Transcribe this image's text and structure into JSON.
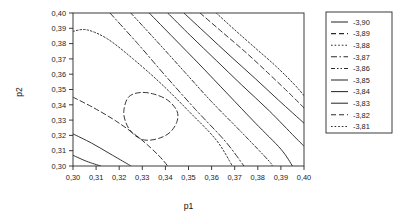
{
  "chart_data": {
    "type": "line",
    "subtype": "contour",
    "title": "",
    "xlabel": "p1",
    "ylabel": "p2",
    "xlim": [
      0.3,
      0.4
    ],
    "ylim": [
      0.3,
      0.4
    ],
    "grid": false,
    "decimal_separator": ",",
    "x_tick_labels": [
      "0,30",
      "0,31",
      "0,32",
      "0,33",
      "0,34",
      "0,35",
      "0,36",
      "0,37",
      "0,38",
      "0,39",
      "0,40"
    ],
    "y_tick_labels": [
      "0,30",
      "0,31",
      "0,32",
      "0,33",
      "0,34",
      "0,35",
      "0,36",
      "0,37",
      "0,38",
      "0,39",
      "0,40"
    ],
    "x_tick_values": [
      0.3,
      0.31,
      0.32,
      0.33,
      0.34,
      0.35,
      0.36,
      0.37,
      0.38,
      0.39,
      0.4
    ],
    "y_tick_values": [
      0.3,
      0.31,
      0.32,
      0.33,
      0.34,
      0.35,
      0.36,
      0.37,
      0.38,
      0.39,
      0.4
    ],
    "legend_position": "right-outside",
    "legend_title": "",
    "levels": [
      {
        "label": "-3,90",
        "value": -3.9,
        "dash": "none"
      },
      {
        "label": "-3,89",
        "value": -3.89,
        "dash": "5,3"
      },
      {
        "label": "-3,88",
        "value": -3.88,
        "dash": "1.6,2"
      },
      {
        "label": "-3,87",
        "value": -3.87,
        "dash": "6,2.5,1.5,2.5"
      },
      {
        "label": "-3,86",
        "value": -3.86,
        "dash": "4,2,1.5,2,1.5,2"
      },
      {
        "label": "-3,85",
        "value": -3.85,
        "dash": "none"
      },
      {
        "label": "-3,84",
        "value": -3.84,
        "dash": "none"
      },
      {
        "label": "-3,83",
        "value": -3.83,
        "dash": "none"
      },
      {
        "label": "-3,82",
        "value": -3.82,
        "dash": "5,3"
      },
      {
        "label": "-3,81",
        "value": -3.81,
        "dash": "1.6,2"
      }
    ],
    "extremum": {
      "x": 0.335,
      "y": 0.333,
      "label": "-3,82 closed contour (local optimum)"
    },
    "contours": [
      {
        "level": "-3,81",
        "dash": "1.6,2",
        "points": [
          [
            0.362,
            0.4
          ],
          [
            0.37,
            0.389
          ],
          [
            0.379,
            0.377
          ],
          [
            0.388,
            0.365
          ],
          [
            0.396,
            0.353
          ],
          [
            0.4,
            0.346
          ]
        ]
      },
      {
        "level": "-3,82",
        "dash": "5,3",
        "points": [
          [
            0.324,
            0.345
          ],
          [
            0.329,
            0.348
          ],
          [
            0.335,
            0.347
          ],
          [
            0.341,
            0.343
          ],
          [
            0.345,
            0.336
          ],
          [
            0.345,
            0.329
          ],
          [
            0.342,
            0.322
          ],
          [
            0.337,
            0.318
          ],
          [
            0.331,
            0.317
          ],
          [
            0.326,
            0.321
          ],
          [
            0.323,
            0.328
          ],
          [
            0.322,
            0.336
          ],
          [
            0.324,
            0.345
          ]
        ]
      },
      {
        "level": "-3,82b",
        "dash": "5,3",
        "points": [
          [
            0.355,
            0.4
          ],
          [
            0.365,
            0.387
          ],
          [
            0.375,
            0.374
          ],
          [
            0.385,
            0.36
          ],
          [
            0.394,
            0.347
          ],
          [
            0.4,
            0.338
          ]
        ]
      },
      {
        "level": "-3,83",
        "dash": "none",
        "points": [
          [
            0.348,
            0.4
          ],
          [
            0.358,
            0.386
          ],
          [
            0.368,
            0.372
          ],
          [
            0.379,
            0.357
          ],
          [
            0.389,
            0.343
          ],
          [
            0.4,
            0.328
          ]
        ]
      },
      {
        "level": "-3,84",
        "dash": "none",
        "points": [
          [
            0.341,
            0.4
          ],
          [
            0.351,
            0.385
          ],
          [
            0.362,
            0.369
          ],
          [
            0.373,
            0.353
          ],
          [
            0.385,
            0.336
          ],
          [
            0.396,
            0.319
          ],
          [
            0.4,
            0.313
          ]
        ]
      },
      {
        "level": "-3,85",
        "dash": "none",
        "points": [
          [
            0.333,
            0.4
          ],
          [
            0.344,
            0.383
          ],
          [
            0.355,
            0.366
          ],
          [
            0.367,
            0.347
          ],
          [
            0.379,
            0.328
          ],
          [
            0.39,
            0.311
          ],
          [
            0.395,
            0.3
          ]
        ]
      },
      {
        "level": "-3,86",
        "dash": "4,2,1.5,2,1.5,2",
        "points": [
          [
            0.325,
            0.4
          ],
          [
            0.336,
            0.382
          ],
          [
            0.348,
            0.362
          ],
          [
            0.36,
            0.342
          ],
          [
            0.373,
            0.322
          ],
          [
            0.385,
            0.303
          ],
          [
            0.386,
            0.3
          ]
        ]
      },
      {
        "level": "-3,87",
        "dash": "6,2.5,1.5,2.5",
        "points": [
          [
            0.316,
            0.4
          ],
          [
            0.328,
            0.38
          ],
          [
            0.34,
            0.359
          ],
          [
            0.353,
            0.337
          ],
          [
            0.366,
            0.316
          ],
          [
            0.374,
            0.3
          ]
        ]
      },
      {
        "level": "-3,88",
        "dash": "1.6,2",
        "points": [
          [
            0.3,
            0.388
          ],
          [
            0.306,
            0.389
          ],
          [
            0.315,
            0.383
          ],
          [
            0.326,
            0.37
          ],
          [
            0.338,
            0.354
          ],
          [
            0.35,
            0.336
          ],
          [
            0.362,
            0.317
          ],
          [
            0.369,
            0.3
          ]
        ]
      },
      {
        "level": "-3,89",
        "dash": "5,3",
        "points": [
          [
            0.3,
            0.345
          ],
          [
            0.309,
            0.338
          ],
          [
            0.319,
            0.329
          ],
          [
            0.329,
            0.318
          ],
          [
            0.337,
            0.307
          ],
          [
            0.341,
            0.3
          ]
        ]
      },
      {
        "level": "-3,90",
        "dash": "none",
        "points": [
          [
            0.3,
            0.321
          ],
          [
            0.308,
            0.315
          ],
          [
            0.316,
            0.308
          ],
          [
            0.324,
            0.301
          ],
          [
            0.325,
            0.3
          ]
        ]
      },
      {
        "level": "-3,90b",
        "dash": "none",
        "points": [
          [
            0.3,
            0.307
          ],
          [
            0.306,
            0.303
          ],
          [
            0.312,
            0.3
          ]
        ]
      }
    ]
  },
  "axes": {
    "x_title": "p1",
    "y_title": "p2"
  }
}
